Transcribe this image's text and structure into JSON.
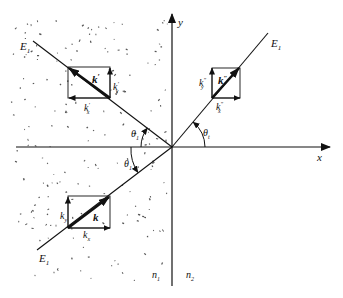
{
  "figure": {
    "type": "reflection-refraction-diagram",
    "axes": {
      "x_label": "x",
      "y_label": "y"
    },
    "media": {
      "left": "n",
      "left_sub": "1",
      "right": "n",
      "right_sub": "2"
    },
    "colors": {
      "ink": "#111111",
      "background": "#ffffff",
      "dots": "#555555"
    },
    "rays": {
      "incident": {
        "field_label": "E",
        "field_sub": "1",
        "angle_label": "θ",
        "angle_sub": "1"
      },
      "reflected": {
        "field_label": "E",
        "field_sub": "1",
        "angle_label": "θ",
        "angle_sub": "1"
      },
      "refracted": {
        "field_label": "E",
        "field_sub": "1",
        "angle_label": "θ",
        "angle_sub": "t"
      }
    },
    "wave_vectors": {
      "incident": {
        "k": "k",
        "kx": "k",
        "kx_sub": "x",
        "ky": "k",
        "ky_sub": "y"
      },
      "reflected": {
        "k": "k",
        "k_sup": "′",
        "kx": "k",
        "kx_sup": "′",
        "kx_sub": "x",
        "ky": "k",
        "ky_sup": "′",
        "ky_sub": "y"
      },
      "refracted": {
        "k": "k",
        "k_sup": "″",
        "kx": "k",
        "kx_sup": "″",
        "kx_sub": "x",
        "ky": "k",
        "ky_sup": "″",
        "ky_sub": "y"
      }
    }
  }
}
